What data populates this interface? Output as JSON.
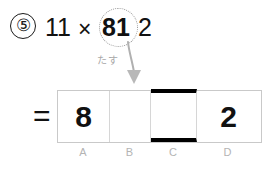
{
  "problem": {
    "item_number": "⑤",
    "expression": {
      "left_factor": "11",
      "operator": "×",
      "highlighted_digits": "81",
      "trailing_digit": "2"
    },
    "highlight_shape": "dotted-circle"
  },
  "annotation": {
    "label": "たす",
    "label_meaning": "add",
    "arrow": "down-arrow",
    "color": "#a8a8a8"
  },
  "answer": {
    "equals_sign": "=",
    "cells": [
      {
        "label": "A",
        "value": "8",
        "emphasis": false
      },
      {
        "label": "B",
        "value": "",
        "emphasis": false
      },
      {
        "label": "C",
        "value": "",
        "emphasis": true
      },
      {
        "label": "D",
        "value": "2",
        "emphasis": false
      }
    ]
  },
  "colors": {
    "ink": "#111111",
    "grid_line": "#c9c9c9",
    "cell_divider": "#d6d6d6",
    "emphasis_rule": "#000000",
    "annotation_gray": "#a8a8a8",
    "label_gray": "#b4b4b4",
    "background": "#ffffff"
  }
}
